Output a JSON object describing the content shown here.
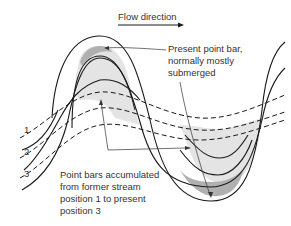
{
  "diagram": {
    "flow_label": "Flow direction",
    "present_bar_label": [
      "Present point bar,",
      "normally mostly",
      "submerged"
    ],
    "accumulated_label": [
      "Point bars accumulated",
      "from former stream",
      "position 1 to present",
      "position 3"
    ],
    "positions": [
      "1",
      "2",
      "3"
    ],
    "colors": {
      "present_bar": "#b0b0b0",
      "former_bars": "#e4e4e4",
      "lines": "#1a1a1a",
      "text": "#333333"
    }
  }
}
